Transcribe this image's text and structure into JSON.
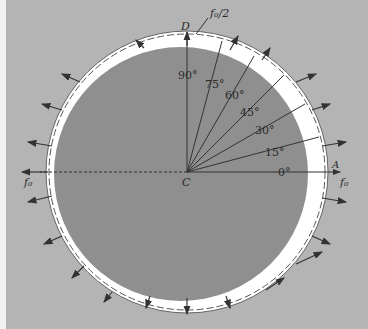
{
  "figure": {
    "background_color": "#b4b4b4",
    "disk_color": "#8f8f8f",
    "ring_color": "#ffffff",
    "line_color": "#333333",
    "labels": {
      "top_point": "D",
      "top_force": "f₀/2",
      "center": "C",
      "right_point": "A",
      "left_force": "f₀",
      "right_force": "f₀"
    },
    "angles": [
      {
        "label": "90°",
        "deg": 90
      },
      {
        "label": "75°",
        "deg": 75
      },
      {
        "label": "60°",
        "deg": 60
      },
      {
        "label": "45°",
        "deg": 45
      },
      {
        "label": "30°",
        "deg": 30
      },
      {
        "label": "15°",
        "deg": 15
      },
      {
        "label": "0°",
        "deg": 0
      }
    ]
  }
}
